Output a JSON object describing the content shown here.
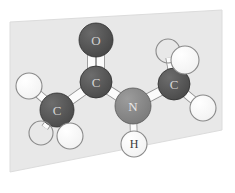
{
  "scene": {
    "title": "N-methylacetamide ball-and-stick model",
    "background_color": "#ffffff",
    "plane": {
      "name": "background-plane",
      "fill_color": "#e8e8e8",
      "stroke_color": "#dcdcdc",
      "points": "10,22 222,10 222,130 10,172"
    }
  },
  "palette": {
    "carbon": "#4a4a4a",
    "carbon_highlight": "#6d6d6d",
    "oxygen": "#474747",
    "oxygen_highlight": "#6a6a6a",
    "nitrogen": "#7b7b7b",
    "nitrogen_highlight": "#9c9c9c",
    "hydrogen": "#ffffff",
    "hydrogen_outline": "#8a8a8a",
    "bond": "#fbfbfb",
    "bond_outline": "#8d8d8d",
    "label_light": "#d8d8d8",
    "label_dark": "#3a3a3a"
  },
  "atoms": [
    {
      "id": "O1",
      "element": "O",
      "label": "O",
      "x": 96,
      "y": 40,
      "r": 17,
      "kind": "oxygen",
      "labeled": true,
      "label_color": "#cfcfcf",
      "font_size": 13
    },
    {
      "id": "C1",
      "element": "C",
      "label": "C",
      "x": 96,
      "y": 82,
      "r": 16,
      "kind": "carbon",
      "labeled": true,
      "label_color": "#d4d4d4",
      "font_size": 13
    },
    {
      "id": "C2",
      "element": "C",
      "label": "C",
      "x": 57,
      "y": 110,
      "r": 17,
      "kind": "carbon",
      "labeled": true,
      "label_color": "#d4d4d4",
      "font_size": 13
    },
    {
      "id": "N1",
      "element": "N",
      "label": "N",
      "x": 133,
      "y": 106,
      "r": 18,
      "kind": "nitrogen",
      "labeled": true,
      "label_color": "#e8e8e8",
      "font_size": 13
    },
    {
      "id": "C3",
      "element": "C",
      "label": "C",
      "x": 174,
      "y": 84,
      "r": 16,
      "kind": "carbon",
      "labeled": true,
      "label_color": "#d4d4d4",
      "font_size": 13
    },
    {
      "id": "H1",
      "element": "H",
      "label": "H",
      "x": 134,
      "y": 144,
      "r": 13,
      "kind": "hydrogen",
      "labeled": true,
      "label_color": "#3a3a3a",
      "font_size": 12
    },
    {
      "id": "H2",
      "element": "H",
      "label": "",
      "x": 29,
      "y": 86,
      "r": 13,
      "kind": "hydrogen",
      "labeled": false,
      "label_color": "#3a3a3a",
      "font_size": 11
    },
    {
      "id": "H3",
      "element": "H",
      "label": "",
      "x": 41,
      "y": 133,
      "r": 12,
      "kind": "hydrogen-back",
      "labeled": false,
      "label_color": "#3a3a3a",
      "font_size": 11
    },
    {
      "id": "H4",
      "element": "H",
      "label": "",
      "x": 70,
      "y": 136,
      "r": 13,
      "kind": "hydrogen",
      "labeled": false,
      "label_color": "#3a3a3a",
      "font_size": 11
    },
    {
      "id": "H5",
      "element": "H",
      "label": "",
      "x": 168,
      "y": 51,
      "r": 12,
      "kind": "hydrogen-back",
      "labeled": false,
      "label_color": "#3a3a3a",
      "font_size": 11
    },
    {
      "id": "H6",
      "element": "H",
      "label": "",
      "x": 185,
      "y": 60,
      "r": 14,
      "kind": "hydrogen",
      "labeled": false,
      "label_color": "#3a3a3a",
      "font_size": 11
    },
    {
      "id": "H7",
      "element": "H",
      "label": "",
      "x": 203,
      "y": 108,
      "r": 13,
      "kind": "hydrogen",
      "labeled": false,
      "label_color": "#3a3a3a",
      "font_size": 11
    }
  ],
  "bonds": [
    {
      "id": "b-C1-O1",
      "from": "C1",
      "to": "O1",
      "order": 2,
      "width": 7,
      "name": "bond-carbonyl-double"
    },
    {
      "id": "b-C1-C2",
      "from": "C1",
      "to": "C2",
      "order": 1,
      "width": 8,
      "name": "bond-c1-c2"
    },
    {
      "id": "b-C1-N1",
      "from": "C1",
      "to": "N1",
      "order": 1,
      "width": 8,
      "name": "bond-c1-n1"
    },
    {
      "id": "b-N1-C3",
      "from": "N1",
      "to": "C3",
      "order": 1,
      "width": 8,
      "name": "bond-n1-c3"
    },
    {
      "id": "b-N1-H1",
      "from": "N1",
      "to": "H1",
      "order": 1,
      "width": 6,
      "name": "bond-n1-h1"
    },
    {
      "id": "b-C2-H2",
      "from": "C2",
      "to": "H2",
      "order": 1,
      "width": 7,
      "name": "bond-c2-h2"
    },
    {
      "id": "b-C2-H3",
      "from": "C2",
      "to": "H3",
      "order": 1,
      "width": 6,
      "name": "bond-c2-h3"
    },
    {
      "id": "b-C2-H4",
      "from": "C2",
      "to": "H4",
      "order": 1,
      "width": 7,
      "name": "bond-c2-h4"
    },
    {
      "id": "b-C3-H5",
      "from": "C3",
      "to": "H5",
      "order": 1,
      "width": 6,
      "name": "bond-c3-h5"
    },
    {
      "id": "b-C3-H6",
      "from": "C3",
      "to": "H6",
      "order": 1,
      "width": 7,
      "name": "bond-c3-h6"
    },
    {
      "id": "b-C3-H7",
      "from": "C3",
      "to": "H7",
      "order": 1,
      "width": 7,
      "name": "bond-c3-h7"
    }
  ]
}
